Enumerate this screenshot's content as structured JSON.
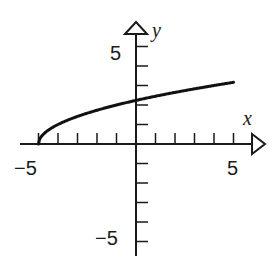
{
  "chart_data": {
    "type": "line",
    "title": "",
    "xlabel": "x",
    "ylabel": "y",
    "xlim": [
      -5,
      5
    ],
    "ylim": [
      -5,
      5
    ],
    "x_ticks": [
      -5,
      -4,
      -3,
      -2,
      -1,
      1,
      2,
      3,
      4,
      5
    ],
    "y_ticks": [
      -5,
      -4,
      -3,
      -2,
      -1,
      1,
      2,
      3,
      4,
      5
    ],
    "x_tick_labels": [
      "-5",
      "5"
    ],
    "y_tick_labels": [
      "5",
      "-5"
    ],
    "grid": false,
    "series": [
      {
        "name": "y = sqrt(x + 5)",
        "x": [
          -5,
          -4.9,
          -4.5,
          -4,
          -3,
          -2,
          -1,
          0,
          1,
          2,
          3,
          4,
          5
        ],
        "values": [
          0,
          0.32,
          0.71,
          1.0,
          1.41,
          1.73,
          2.0,
          2.24,
          2.45,
          2.65,
          2.83,
          3.0,
          3.16
        ]
      }
    ]
  },
  "labels": {
    "x_axis": "x",
    "y_axis": "y",
    "x_min": "−5",
    "x_max": "5",
    "y_max": "5",
    "y_min": "−5"
  },
  "colors": {
    "axis": "#1a1a1a",
    "curve": "#111111",
    "background": "#ffffff"
  }
}
